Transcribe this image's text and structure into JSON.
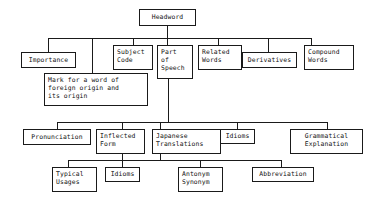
{
  "diagram": {
    "type": "tree-diagram",
    "line_color": "#1a1a1a",
    "box_border_color": "#1a1a1a",
    "background_color": "#ffffff",
    "nodes": {
      "headword": "Headword",
      "importance": "Importance",
      "subject_code": "Subject\nCode",
      "part_of_speech": "Part\nof\nSpeech",
      "related_words": "Related\nWords",
      "derivatives": "Derivatives",
      "compound_words": "Compound\nWords",
      "foreign_origin_mark": "Mark for a word of\nforeign origin and\nits origin",
      "pronunciation": "Pronunciation",
      "inflected_form": "Inflected\nForm",
      "japanese_translations": "Japanese\nTranslations",
      "idioms_level3": "Idioms",
      "grammatical_explanation": "Grammatical\nExplanation",
      "typical_usages": "Typical\nUsages",
      "idioms_level4": "Idioms",
      "antonym_synonym": "Antonym\nSynonym",
      "abbreviation": "Abbreviation"
    }
  }
}
